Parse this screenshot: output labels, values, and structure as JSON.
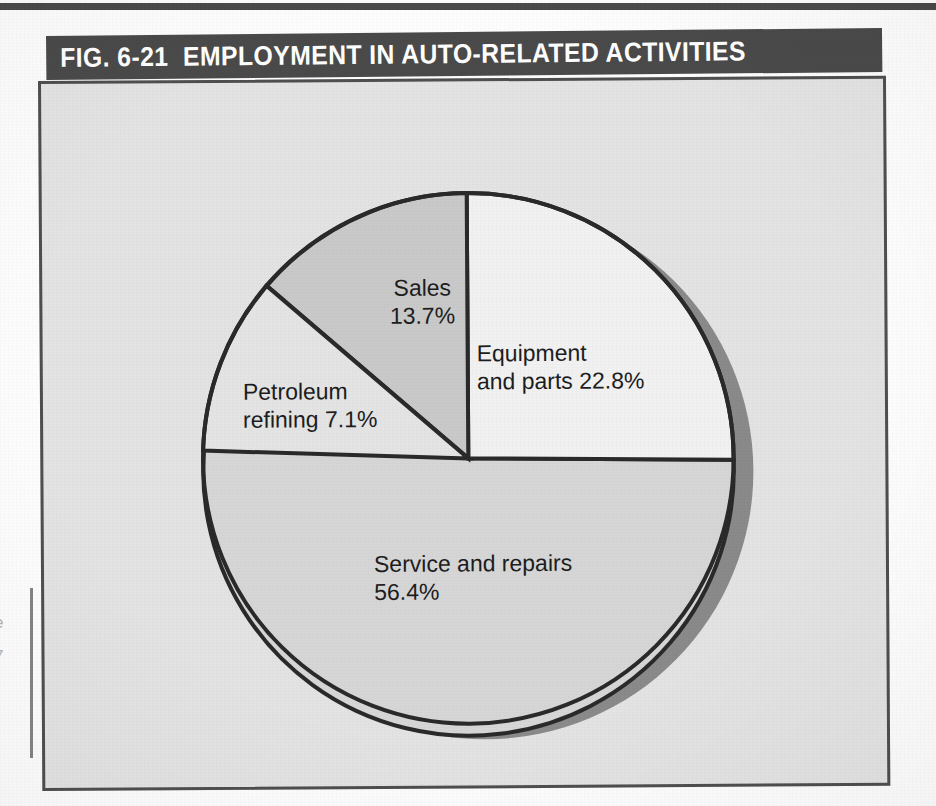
{
  "figure": {
    "title": "FIG. 6-21  EMPLOYMENT IN AUTO-RELATED ACTIVITIES",
    "figure_number": "FIG. 6-21",
    "caption_text": "EMPLOYMENT IN AUTO-RELATED ACTIVITIES"
  },
  "page": {
    "margin_fragments": "e\n7\n."
  },
  "colors": {
    "title_bar": "#4a4a4a",
    "title_text": "#ffffff",
    "plot_background": "#e3e3e3",
    "plot_border": "#4f4f4f",
    "pie_outline": "#2a2a2a",
    "pie_shadow": "#8a8a8a",
    "page_background": "#fdfdfd",
    "top_rule": "#4a4a4a",
    "slice_equipment": "#f1f1f1",
    "slice_service": "#d6d6d6",
    "slice_petroleum": "#e4e4e4",
    "slice_sales": "#c9c9c9"
  },
  "chart_data": {
    "type": "pie",
    "title": "FIG. 6-21  EMPLOYMENT IN AUTO-RELATED ACTIVITIES",
    "xlabel": "",
    "ylabel": "",
    "legend_position": "none",
    "grid": false,
    "units": "percent",
    "total": 100.0,
    "categories": [
      "Equipment and parts",
      "Service and repairs",
      "Petroleum refining",
      "Sales"
    ],
    "values": [
      22.8,
      56.4,
      7.1,
      13.7
    ],
    "slices": [
      {
        "name": "Equipment and parts",
        "value": 22.8,
        "label": "Equipment\nand parts 22.8%",
        "label_line_1": "Equipment",
        "label_line_2": "and parts 22.8%",
        "percent_text": "22.8%",
        "fill": "#f1f1f1",
        "start_angle_deg": 0,
        "end_angle_deg": 82.08
      },
      {
        "name": "Service and repairs",
        "value": 56.4,
        "label": "Service and repairs\n56.4%",
        "label_line_1": "Service and repairs",
        "label_line_2": "56.4%",
        "percent_text": "56.4%",
        "fill": "#d6d6d6",
        "start_angle_deg": 82.08,
        "end_angle_deg": 285.12
      },
      {
        "name": "Petroleum refining",
        "value": 7.1,
        "label": "Petroleum\nrefining 7.1%",
        "label_line_1": "Petroleum",
        "label_line_2": "refining 7.1%",
        "percent_text": "7.1%",
        "fill": "#e4e4e4",
        "start_angle_deg": 285.12,
        "end_angle_deg": 310.68
      },
      {
        "name": "Sales",
        "value": 13.7,
        "label": "Sales\n13.7%",
        "label_line_1": "Sales",
        "label_line_2": "13.7%",
        "percent_text": "13.7%",
        "fill": "#c9c9c9",
        "start_angle_deg": 310.68,
        "end_angle_deg": 360
      }
    ]
  }
}
